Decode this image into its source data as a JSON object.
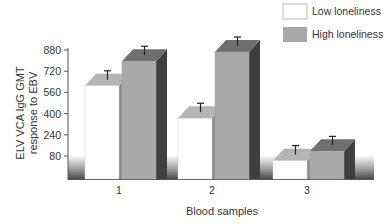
{
  "chart_data": {
    "type": "bar",
    "style": "3d",
    "title": "",
    "xlabel": "Blood samples",
    "ylabel": "ELV VCA IgG GMT response to EBV",
    "ylabel_lines": [
      "ELV VCA IgG GMT",
      "response to EBV"
    ],
    "categories": [
      "1",
      "2",
      "3"
    ],
    "yticks": [
      80,
      240,
      400,
      560,
      720,
      880
    ],
    "ylim": [
      0,
      880
    ],
    "grid": false,
    "legend_position": "top-right",
    "series": [
      {
        "name": "Low loneliness",
        "color": "#ffffff",
        "values": [
          610,
          365,
          45
        ]
      },
      {
        "name": "High loneliness",
        "color": "#a8a8a8",
        "values": [
          795,
          865,
          115
        ]
      }
    ],
    "error_bars": true
  },
  "legend": {
    "items": [
      {
        "label": "Low loneliness",
        "swatch": "#ffffff"
      },
      {
        "label": "High loneliness",
        "swatch": "#a8a8a8"
      }
    ]
  }
}
